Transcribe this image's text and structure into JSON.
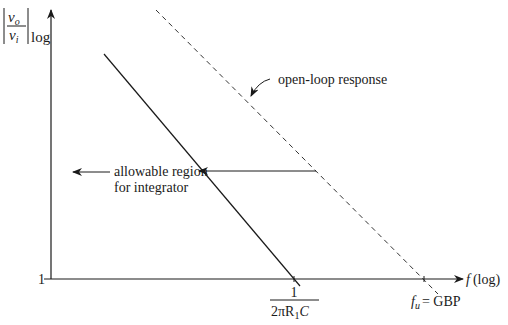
{
  "diagram": {
    "y_axis": {
      "label_numerator": "v",
      "label_numerator_sub": "o",
      "label_denominator": "v",
      "label_denominator_sub": "i",
      "label_suffix": "log",
      "tick_label": "1"
    },
    "x_axis": {
      "label_var": "f",
      "label_suffix": "(log)"
    },
    "annotations": {
      "open_loop": "open-loop response",
      "region_line1": "allowable region",
      "region_line2": "for integrator"
    },
    "x_ticks": {
      "integrator_numerator": "1",
      "integrator_denominator": "2πR",
      "integrator_denominator_sub": "1",
      "integrator_denominator_tail": "C",
      "fu_var": "f",
      "fu_sub": "u",
      "fu_eq": "= GBP"
    },
    "colors": {
      "line": "#1a1a1a",
      "dashed": "#333333",
      "background": "#ffffff"
    }
  }
}
